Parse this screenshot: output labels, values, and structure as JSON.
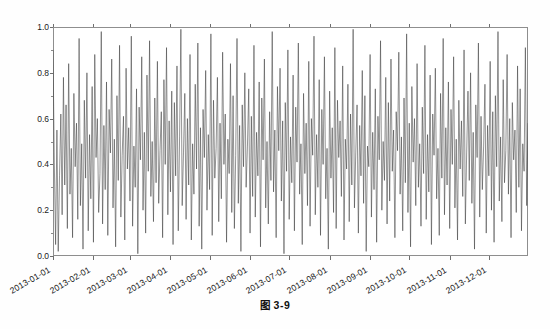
{
  "page": {
    "caption": "图 3-9",
    "bleed_top": "",
    "bleed_bottom": ""
  },
  "chart_data": {
    "type": "line",
    "title": "",
    "xlabel": "",
    "ylabel": "",
    "grid": false,
    "legend": null,
    "line_color": "#3a3a3a",
    "line_width": 0.55,
    "xlim": [
      "2013-01-01",
      "2013-12-31"
    ],
    "ylim": [
      0.0,
      1.0
    ],
    "ytick_labels": [
      "0.0",
      "0.2",
      "0.4",
      "0.6",
      "0.8",
      "1.0"
    ],
    "ytick_values": [
      0.0,
      0.2,
      0.4,
      0.6,
      0.8,
      1.0
    ],
    "xtick_labels": [
      "2013-01-01",
      "2013-02-01",
      "2013-03-01",
      "2013-04-01",
      "2013-05-01",
      "2013-06-01",
      "2013-07-01",
      "2013-08-01",
      "2013-09-01",
      "2013-10-01",
      "2013-11-01",
      "2013-12-01"
    ],
    "xtick_day_index": [
      0,
      31,
      59,
      90,
      120,
      151,
      181,
      212,
      243,
      273,
      304,
      334
    ],
    "n_points": 365,
    "series": [
      {
        "name": "series-1",
        "values": [
          0.9,
          0.41,
          0.05,
          0.55,
          0.02,
          0.35,
          0.62,
          0.18,
          0.78,
          0.31,
          0.66,
          0.12,
          0.84,
          0.27,
          0.47,
          0.08,
          0.71,
          0.39,
          0.58,
          0.16,
          0.95,
          0.22,
          0.49,
          0.03,
          0.68,
          0.34,
          0.8,
          0.11,
          0.53,
          0.25,
          0.74,
          0.06,
          0.88,
          0.43,
          0.6,
          0.19,
          0.36,
          0.98,
          0.14,
          0.57,
          0.29,
          0.76,
          0.09,
          0.64,
          0.45,
          0.86,
          0.21,
          0.51,
          0.04,
          0.7,
          0.33,
          0.92,
          0.17,
          0.44,
          0.61,
          0.07,
          0.82,
          0.38,
          0.56,
          0.24,
          0.96,
          0.13,
          0.48,
          0.3,
          0.73,
          0.01,
          0.65,
          0.42,
          0.87,
          0.2,
          0.54,
          0.1,
          0.79,
          0.37,
          0.94,
          0.26,
          0.5,
          0.15,
          0.69,
          0.32,
          0.85,
          0.23,
          0.46,
          0.63,
          0.08,
          0.77,
          0.4,
          0.91,
          0.18,
          0.59,
          0.28,
          0.72,
          0.05,
          0.67,
          0.35,
          0.83,
          0.11,
          0.52,
          0.99,
          0.22,
          0.45,
          0.71,
          0.16,
          0.6,
          0.31,
          0.88,
          0.07,
          0.49,
          0.27,
          0.75,
          0.38,
          0.93,
          0.13,
          0.56,
          0.03,
          0.64,
          0.43,
          0.81,
          0.2,
          0.53,
          0.29,
          0.97,
          0.09,
          0.68,
          0.34,
          0.47,
          0.78,
          0.15,
          0.58,
          0.25,
          0.89,
          0.4,
          0.62,
          0.06,
          0.51,
          0.36,
          0.84,
          0.19,
          0.7,
          0.12,
          0.44,
          0.95,
          0.23,
          0.57,
          0.02,
          0.66,
          0.39,
          0.8,
          0.3,
          0.48,
          0.73,
          0.1,
          0.61,
          0.26,
          0.92,
          0.17,
          0.54,
          0.35,
          0.76,
          0.04,
          0.69,
          0.42,
          0.86,
          0.21,
          0.5,
          0.14,
          0.63,
          0.33,
          0.98,
          0.28,
          0.55,
          0.08,
          0.74,
          0.46,
          0.82,
          0.24,
          0.59,
          0.01,
          0.67,
          0.37,
          0.9,
          0.16,
          0.52,
          0.32,
          0.79,
          0.11,
          0.65,
          0.41,
          0.93,
          0.27,
          0.49,
          0.05,
          0.71,
          0.36,
          0.58,
          0.22,
          0.85,
          0.13,
          0.6,
          0.44,
          0.96,
          0.18,
          0.53,
          0.3,
          0.77,
          0.09,
          0.64,
          0.4,
          0.87,
          0.25,
          0.47,
          0.03,
          0.72,
          0.34,
          0.56,
          0.19,
          0.91,
          0.12,
          0.68,
          0.43,
          0.59,
          0.26,
          0.83,
          0.07,
          0.51,
          0.38,
          0.75,
          0.15,
          0.62,
          0.31,
          0.99,
          0.21,
          0.45,
          0.66,
          0.1,
          0.57,
          0.35,
          0.81,
          0.23,
          0.7,
          0.02,
          0.48,
          0.39,
          0.88,
          0.17,
          0.54,
          0.29,
          0.73,
          0.06,
          0.61,
          0.42,
          0.94,
          0.2,
          0.5,
          0.33,
          0.78,
          0.14,
          0.67,
          0.24,
          0.86,
          0.37,
          0.55,
          0.08,
          0.63,
          0.46,
          0.89,
          0.27,
          0.52,
          0.11,
          0.69,
          0.32,
          0.97,
          0.19,
          0.58,
          0.04,
          0.74,
          0.41,
          0.6,
          0.22,
          0.84,
          0.3,
          0.49,
          0.13,
          0.65,
          0.36,
          0.92,
          0.16,
          0.53,
          0.28,
          0.79,
          0.05,
          0.62,
          0.44,
          0.82,
          0.25,
          0.47,
          0.09,
          0.71,
          0.34,
          0.95,
          0.18,
          0.56,
          0.31,
          0.76,
          0.12,
          0.64,
          0.4,
          0.87,
          0.21,
          0.51,
          0.07,
          0.68,
          0.38,
          0.59,
          0.26,
          0.9,
          0.14,
          0.45,
          0.72,
          0.33,
          0.8,
          0.23,
          0.54,
          0.03,
          0.66,
          0.43,
          0.93,
          0.17,
          0.61,
          0.29,
          0.48,
          0.75,
          0.1,
          0.57,
          0.35,
          0.85,
          0.2,
          0.63,
          0.06,
          0.7,
          0.39,
          0.98,
          0.24,
          0.52,
          0.15,
          0.77,
          0.32,
          0.46,
          0.88,
          0.27,
          0.6,
          0.08,
          0.67,
          0.42,
          0.55,
          0.19,
          0.83,
          0.3,
          0.73,
          0.11,
          0.49,
          0.37,
          0.91,
          0.22,
          0.58
        ]
      }
    ]
  }
}
